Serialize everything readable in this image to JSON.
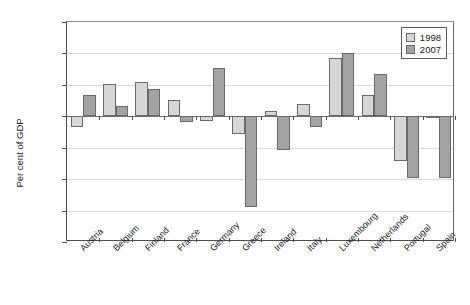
{
  "chart_data": {
    "type": "bar",
    "title": "",
    "xlabel": "",
    "ylabel": "Per cent of GDP",
    "ylim": [
      -20,
      15
    ],
    "yticks": [
      15,
      10,
      5,
      0,
      -5,
      -10,
      -15,
      -20
    ],
    "ytick_labels": [
      "15",
      "10",
      "5",
      "0",
      "-5",
      "-10",
      "-15",
      "-20"
    ],
    "grid": true,
    "legend_position": "top-right",
    "categories": [
      "Austria",
      "Belgium",
      "Finland",
      "France",
      "Germany",
      "Greece",
      "Ireland",
      "Italy",
      "Luxembourg",
      "Netherlands",
      "Portugal",
      "Spain"
    ],
    "series": [
      {
        "name": "1998",
        "color": "#d6d6d6",
        "values": [
          -1.7,
          5.2,
          5.5,
          2.6,
          -0.7,
          -2.8,
          0.8,
          1.9,
          9.3,
          3.4,
          -7.1,
          -0.2
        ]
      },
      {
        "name": "2007",
        "color": "#a3a3a3",
        "values": [
          3.4,
          1.6,
          4.3,
          -0.9,
          7.7,
          -14.5,
          -5.3,
          -1.7,
          10.1,
          6.8,
          -9.8,
          -9.8
        ]
      }
    ]
  },
  "legend": {
    "entries": [
      {
        "label": "1998",
        "swatch": "light-gray"
      },
      {
        "label": "2007",
        "swatch": "dark-gray"
      }
    ]
  },
  "axes": {
    "y_title": "Per cent of GDP"
  }
}
